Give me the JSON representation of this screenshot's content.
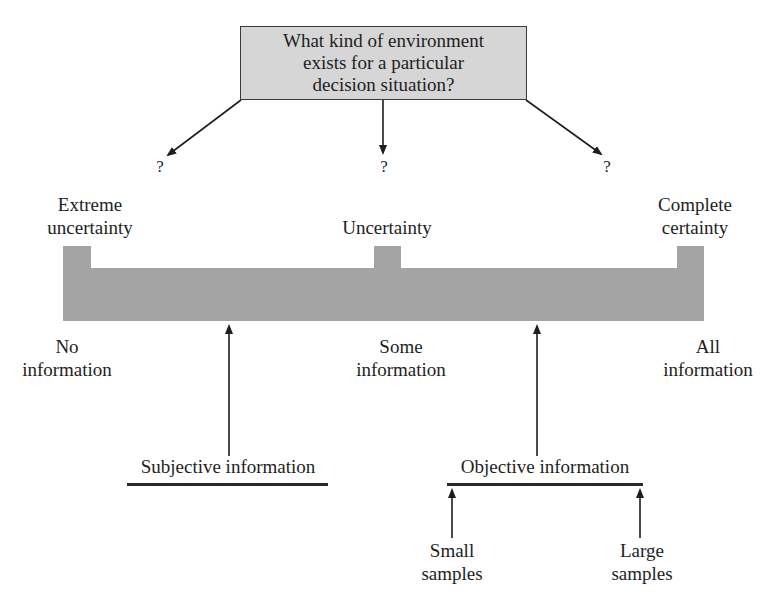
{
  "question": {
    "text": "What kind of environment\nexists for a particular\ndecision situation?"
  },
  "branches": [
    {
      "label": "?"
    },
    {
      "label": "?"
    },
    {
      "label": "?"
    }
  ],
  "environments": [
    {
      "label": "Extreme\nuncertainty"
    },
    {
      "label": "Uncertainty"
    },
    {
      "label": "Complete\ncertainty"
    }
  ],
  "information_levels": [
    {
      "label": "No\ninformation"
    },
    {
      "label": "Some\ninformation"
    },
    {
      "label": "All\ninformation"
    }
  ],
  "information_types": [
    {
      "label": "Subjective information"
    },
    {
      "label": "Objective information"
    }
  ],
  "sample_sizes": [
    {
      "label": "Small\nsamples"
    },
    {
      "label": "Large\nsamples"
    }
  ],
  "colors": {
    "box_fill": "#d6d6d6",
    "bar_fill": "#a4a4a4",
    "line": "#1e1e1e"
  }
}
